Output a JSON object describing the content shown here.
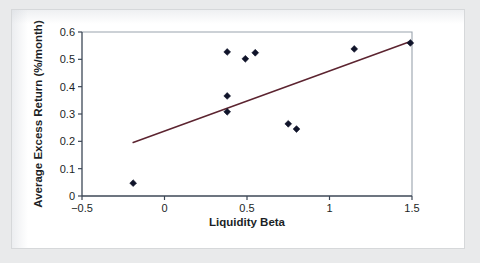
{
  "figure": {
    "background_color": "#ffffff",
    "page_background_color": "#e9eaeb"
  },
  "chart_data": {
    "type": "scatter",
    "title": "",
    "subtitle": "",
    "xlabel": "Liquidity Beta",
    "ylabel": "Average Excess Return (%/month)",
    "xlim": [
      -0.5,
      1.5
    ],
    "ylim": [
      0,
      0.6
    ],
    "xticks": [
      -0.5,
      0,
      0.5,
      1,
      1.5
    ],
    "xtick_labels": [
      "−0.5",
      "0",
      "0.5",
      "1",
      "1.5"
    ],
    "yticks": [
      0,
      0.1,
      0.2,
      0.3,
      0.4,
      0.5,
      0.6
    ],
    "ytick_labels": [
      "0",
      "0.1",
      "0.2",
      "0.3",
      "0.4",
      "0.5",
      "0.6"
    ],
    "grid": false,
    "legend": "none",
    "marker": "diamond",
    "marker_color": "#10142a",
    "x": [
      -0.19,
      0.38,
      0.38,
      0.38,
      0.49,
      0.55,
      0.75,
      0.8,
      1.15,
      1.49
    ],
    "y": [
      0.047,
      0.308,
      0.366,
      0.527,
      0.502,
      0.524,
      0.264,
      0.245,
      0.538,
      0.56
    ],
    "series": [
      {
        "name": "Portfolios",
        "points": [
          {
            "x": -0.19,
            "y": 0.047
          },
          {
            "x": 0.38,
            "y": 0.308
          },
          {
            "x": 0.38,
            "y": 0.366
          },
          {
            "x": 0.38,
            "y": 0.527
          },
          {
            "x": 0.49,
            "y": 0.502
          },
          {
            "x": 0.55,
            "y": 0.524
          },
          {
            "x": 0.75,
            "y": 0.264
          },
          {
            "x": 0.8,
            "y": 0.245
          },
          {
            "x": 1.15,
            "y": 0.538
          },
          {
            "x": 1.49,
            "y": 0.56
          }
        ]
      }
    ],
    "fit_line": {
      "color": "#5c2430",
      "x_start": -0.19,
      "y_start": 0.196,
      "x_end": 1.49,
      "y_end": 0.565
    }
  }
}
